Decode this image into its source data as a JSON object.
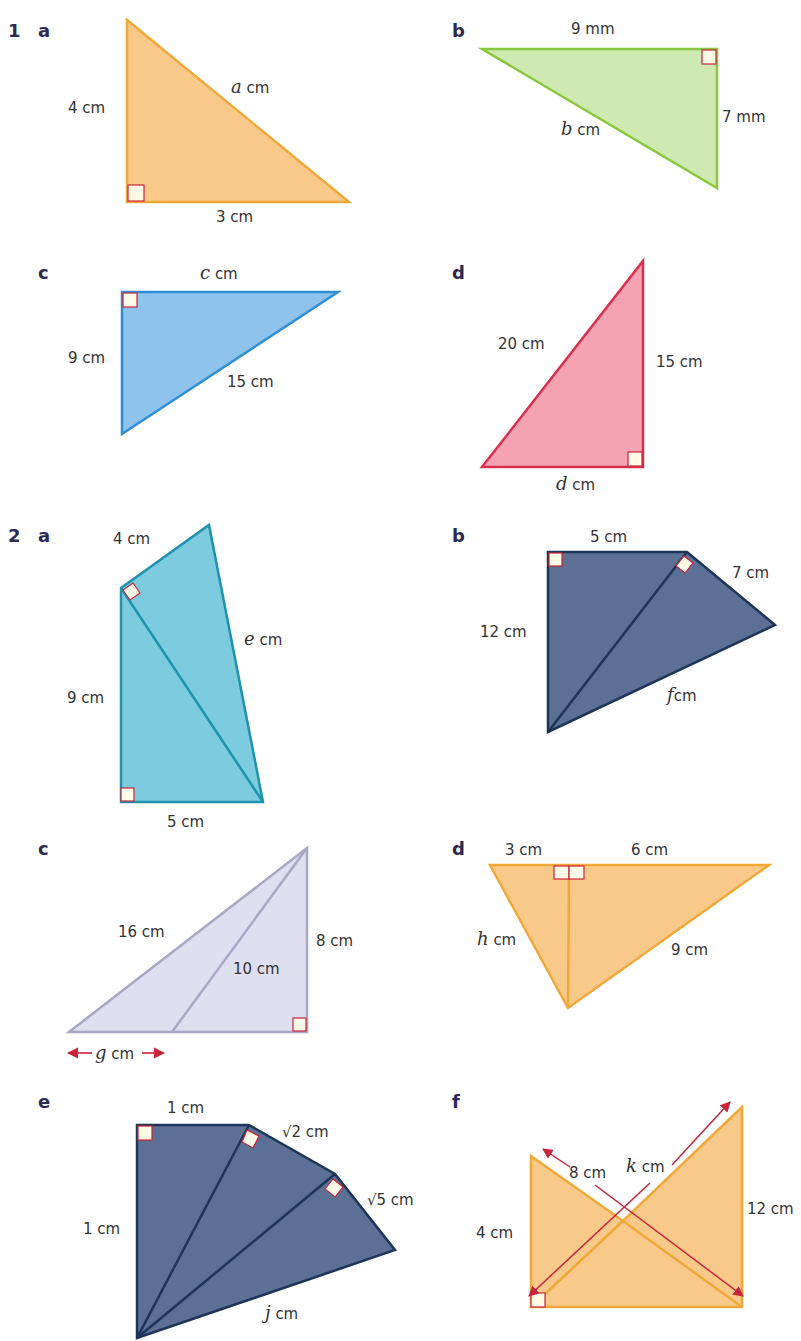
{
  "colors": {
    "orange_fill": "#f9c98a",
    "orange_stroke": "#f0a938",
    "green_fill": "#cfe9b3",
    "green_stroke": "#8cc63f",
    "blue_fill": "#8ec3ee",
    "blue_stroke": "#2e8fd6",
    "pink_fill": "#f5a3b3",
    "pink_stroke": "#d9304f",
    "teal_fill": "#7ccbdf",
    "teal_stroke": "#1f93ad",
    "navy_fill": "#5b7094",
    "navy_stroke": "#1d3557",
    "lavender_fill": "#dedff1",
    "lavender_stroke": "#a9a8c4",
    "arrow": "#c8243a",
    "right_angle": "#c8243a",
    "question_number": "#2b2a55"
  },
  "questions": [
    {
      "number": "1",
      "parts": [
        {
          "letter": "a",
          "labels": {
            "vertical": "4 cm",
            "base": "3 cm",
            "hyp_var": "a",
            "hyp_unit": "cm"
          }
        },
        {
          "letter": "b",
          "labels": {
            "top": "9 mm",
            "right": "7 mm",
            "hyp_var": "b",
            "hyp_unit": "cm"
          }
        },
        {
          "letter": "c",
          "labels": {
            "top_var": "c",
            "top_unit": "cm",
            "left": "9 cm",
            "hyp": "15 cm"
          }
        },
        {
          "letter": "d",
          "labels": {
            "hyp": "20 cm",
            "right": "15 cm",
            "base_var": "d",
            "base_unit": "cm"
          }
        }
      ]
    },
    {
      "number": "2",
      "parts": [
        {
          "letter": "a",
          "labels": {
            "top": "4 cm",
            "left": "9 cm",
            "base": "5 cm",
            "side_var": "e",
            "side_unit": "cm"
          }
        },
        {
          "letter": "b",
          "labels": {
            "top": "5 cm",
            "left": "12 cm",
            "right": "7 cm",
            "side_var": "f",
            "side_unit": "cm"
          }
        },
        {
          "letter": "c",
          "labels": {
            "hyp": "16 cm",
            "inner": "10 cm",
            "right": "8 cm",
            "base_var": "g",
            "base_unit": "cm"
          }
        },
        {
          "letter": "d",
          "labels": {
            "top_left": "3 cm",
            "top_right": "6 cm",
            "left_var": "h",
            "left_unit": "cm",
            "right": "9 cm"
          }
        },
        {
          "letter": "e",
          "labels": {
            "top": "1 cm",
            "left": "1 cm",
            "seg2": "√2 cm",
            "seg3": "√5 cm",
            "bottom_var": "j",
            "bottom_unit": "cm"
          }
        },
        {
          "letter": "f",
          "labels": {
            "left": "4 cm",
            "right": "12 cm",
            "diag1": "8 cm",
            "diag2_var": "k",
            "diag2_unit": "cm"
          }
        }
      ]
    }
  ]
}
